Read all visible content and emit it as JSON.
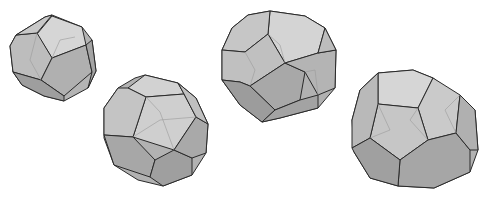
{
  "scene": {
    "description": "Four shaded gray polyhedra (dodecahedron-like solids with pentagonal and truncated faces) on a white background",
    "background": "#ffffff",
    "colors": {
      "light_face": "#d4d4d4",
      "mid_face": "#b8b8b8",
      "dark_face": "#9c9c9c",
      "edge": "#2a2a2a"
    },
    "shapes": [
      {
        "id": "polyhedron-1",
        "label": "small dodecahedron, top-left"
      },
      {
        "id": "polyhedron-2",
        "label": "truncated polyhedron, lower-left center"
      },
      {
        "id": "polyhedron-3",
        "label": "large polyhedron, top-right center"
      },
      {
        "id": "polyhedron-4",
        "label": "polyhedron, lower-right"
      }
    ]
  }
}
